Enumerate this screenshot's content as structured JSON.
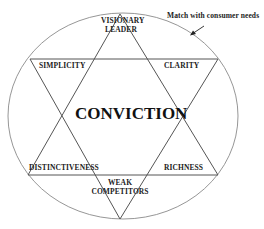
{
  "diagram": {
    "center_label": "CONVICTION",
    "annotation": "Match with consumer needs",
    "points": {
      "top": "VISIONARY LEADER",
      "top_line1": "VISIONARY",
      "top_line2": "LEADER",
      "upper_left": "SIMPLICITY",
      "upper_right": "CLARITY",
      "lower_left": "DISTINCTIVENESS",
      "lower_right": "RICHNESS",
      "bottom_line1": "WEAK",
      "bottom_line2": "COMPETITORS"
    },
    "colors": {
      "line": "#555555",
      "circle": "#888888",
      "text": "#222222"
    }
  }
}
